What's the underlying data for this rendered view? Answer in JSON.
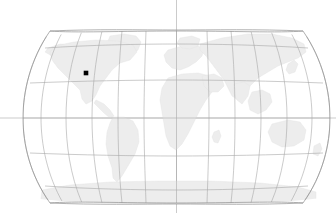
{
  "figure": {
    "name": "world-map-locator",
    "width": 336,
    "height": 213,
    "background_color": "#ffffff",
    "projection": "robinson"
  },
  "map": {
    "land_color": "#ededed",
    "land_stroke_color": "#e4e4e4",
    "graticule_color": "#a8a8a8",
    "graticule_width": 0.6,
    "outline_color": "#8f8f8f",
    "crosshair_color": "#b5b5b5",
    "bounds": {
      "left": 23,
      "right": 330,
      "top": 30,
      "bottom": 204,
      "center_x": 176.5,
      "center_y": 118
    },
    "graticule": {
      "meridian_step_degrees": 30,
      "parallel_step_degrees": 30,
      "meridians": [
        -180,
        -150,
        -120,
        -90,
        -60,
        -30,
        0,
        30,
        60,
        90,
        120,
        150,
        180
      ],
      "parallels": [
        -60,
        -30,
        0,
        30,
        60
      ],
      "parallel_pixel_rows": [
        182,
        150,
        118,
        83,
        48
      ]
    },
    "crosshair": {
      "vertical_x": 176.5,
      "horizontal_y": 118,
      "extends_to_edges": true
    }
  },
  "marker": {
    "name": "location-marker",
    "x": 86,
    "y": 73,
    "size": 4.6,
    "color": "#000000",
    "shape": "square-dot",
    "region_label": "North America"
  },
  "landmasses": [
    "North America",
    "South America",
    "Greenland",
    "Europe",
    "Africa",
    "Asia",
    "Australia",
    "Antarctica"
  ],
  "labels": {
    "title": "",
    "subtitle": "",
    "caption": ""
  },
  "chart_data": {
    "type": "map",
    "title": "",
    "xlabel": "",
    "ylabel": "",
    "projection": "robinson",
    "points": [
      {
        "label": "",
        "x_px": 86,
        "y_px": 73,
        "lon": -112,
        "lat": 43,
        "color": "#000000"
      }
    ],
    "grid": true,
    "legend": "none"
  }
}
